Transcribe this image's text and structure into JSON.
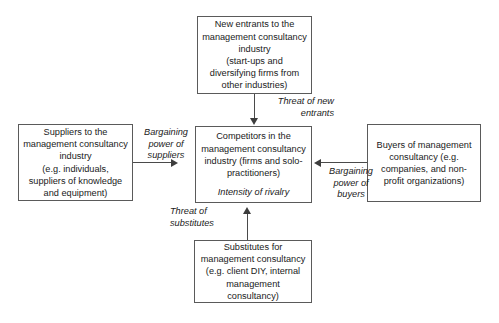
{
  "diagram": {
    "boxes": {
      "new_entrants": {
        "text": "New entrants to the\nmanagement consultancy\nindustry\n(start-ups and\ndiversifying firms from\nother industries)"
      },
      "suppliers": {
        "text": "Suppliers to the\nmanagement consultancy\nindustry\n(e.g. individuals,\nsuppliers of knowledge\nand equipment)"
      },
      "competitors": {
        "text": "Competitors in the\nmanagement consultancy\nindustry (firms and solo-\npractitioners)",
        "subtext": "Intensity of rivalry"
      },
      "buyers": {
        "text": "Buyers of management\nconsultancy (e.g.\ncompanies, and non-\nprofit organizations)"
      },
      "substitutes": {
        "text": "Substitutes for\nmanagement consultancy\n(e.g. client DIY, internal\nmanagement\nconsultancy)"
      }
    },
    "edge_labels": {
      "threat_of_new_entrants": "Threat of new\nentrants",
      "threat_of_substitutes": "Threat of\nsubstitutes",
      "bargaining_power_of_suppliers": "Bargaining\npower of\nsuppliers",
      "bargaining_power_of_buyers": "Bargaining\npower of\nbuyers"
    },
    "colors": {
      "box_border": "#5a5a5a",
      "connector": "#4a4a4a",
      "arrowhead": "#3d3d3d",
      "text": "#1a1a1a",
      "background": "#ffffff"
    }
  }
}
